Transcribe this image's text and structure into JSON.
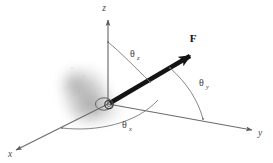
{
  "figure": {
    "background_color": "#ffffff"
  },
  "axes": [
    {
      "id": "x",
      "label": "x",
      "color": "#5a5a5a",
      "label_x": 10,
      "label_y": 155
    },
    {
      "id": "y",
      "label": "y",
      "color": "#5a5a5a",
      "label_x": 259,
      "label_y": 135
    },
    {
      "id": "z",
      "label": "z",
      "color": "#5a5a5a",
      "label_x": 104,
      "label_y": 11
    }
  ],
  "vector": {
    "name": "F",
    "label": "F",
    "color": "#141414",
    "label_x": 193,
    "label_y": 42
  },
  "angles": [
    {
      "id": "theta-z",
      "symbol": "θ",
      "subscript": "z",
      "color": "#3c3c3c",
      "label_x": 130,
      "label_y": 57
    },
    {
      "id": "theta-y",
      "symbol": "θ",
      "subscript": "y",
      "color": "#3c3c3c",
      "label_x": 199,
      "label_y": 86
    },
    {
      "id": "theta-x",
      "symbol": "θ",
      "subscript": "x",
      "color": "#3c3c3c",
      "label_x": 122,
      "label_y": 128
    }
  ],
  "origin": {
    "name": "origin-marker",
    "x": 108,
    "y": 104,
    "ring_color": "#4a4a4a"
  },
  "shadow": {
    "name": "ground-shadow",
    "color": "#9a9a9a",
    "center_x": 86,
    "center_y": 97
  }
}
